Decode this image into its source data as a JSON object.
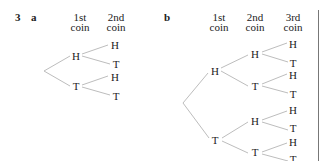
{
  "question": {
    "number": "3"
  },
  "part_a": {
    "label": "a",
    "headers": [
      "1st coin",
      "2nd coin"
    ],
    "header_lines": [
      [
        "1st",
        "coin"
      ],
      [
        "2nd",
        "coin"
      ]
    ],
    "level1": [
      "H",
      "T"
    ],
    "level2": [
      "H",
      "T",
      "H",
      "T"
    ]
  },
  "part_b": {
    "label": "b",
    "headers": [
      "1st coin",
      "2nd coin",
      "3rd coin"
    ],
    "header_lines": [
      [
        "1st",
        "coin"
      ],
      [
        "2nd",
        "coin"
      ],
      [
        "3rd",
        "coin"
      ]
    ],
    "level1": [
      "H",
      "T"
    ],
    "level2": [
      "H",
      "T",
      "H",
      "T"
    ],
    "level3": [
      "H",
      "T",
      "H",
      "T",
      "H",
      "T",
      "H",
      "T"
    ]
  },
  "colors": {
    "branch": "#bbbbbb",
    "text": "#222222",
    "rule": "#777777"
  }
}
